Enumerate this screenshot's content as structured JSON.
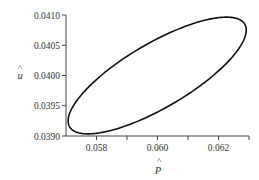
{
  "chart_data": {
    "type": "line",
    "title": "",
    "xlabel": "P̂",
    "ylabel": "û",
    "xlim": [
      0.057,
      0.063
    ],
    "ylim": [
      0.039,
      0.041
    ],
    "x_ticks": [
      0.057,
      0.058,
      0.059,
      0.06,
      0.061,
      0.062,
      0.063
    ],
    "x_tick_labels": [
      "",
      "0.058",
      "",
      "0.060",
      "",
      "0.062",
      ""
    ],
    "y_ticks": [
      0.039,
      0.0395,
      0.04,
      0.0405,
      0.041
    ],
    "y_tick_labels": [
      "0.0390",
      "0.0395",
      "0.0400",
      "0.0405",
      "0.0410"
    ],
    "grid": false,
    "legend": null,
    "series": [
      {
        "name": "closed orbit (limit cycle)",
        "shape": "ellipse",
        "center": {
          "x": 0.05999,
          "y": 0.04
        },
        "x_range": [
          0.05707,
          0.06291
        ],
        "y_range": [
          0.03904,
          0.04097
        ],
        "extremes": {
          "left": {
            "x": 0.05707,
            "y": 0.03927
          },
          "right": {
            "x": 0.06291,
            "y": 0.04075
          },
          "top": {
            "x": 0.06229,
            "y": 0.04097
          },
          "bottom": {
            "x": 0.05777,
            "y": 0.03904
          }
        }
      }
    ]
  },
  "axes": {
    "x_label_main": "P",
    "x_label_hat": "^",
    "y_label_main": "u",
    "y_label_hat": "^"
  }
}
